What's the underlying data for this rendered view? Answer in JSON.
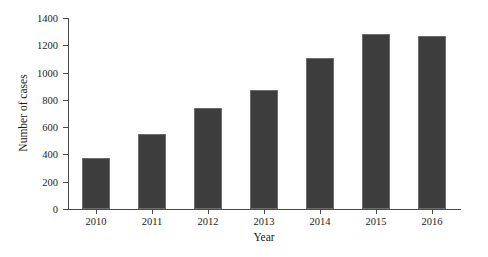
{
  "chart_data": {
    "type": "bar",
    "title": "",
    "xlabel": "Year",
    "ylabel": "Number of cases",
    "categories": [
      "2010",
      "2011",
      "2012",
      "2013",
      "2014",
      "2015",
      "2016"
    ],
    "values": [
      375,
      550,
      740,
      870,
      1105,
      1280,
      1265
    ],
    "series": [
      {
        "name": "Number of cases",
        "values": [
          375,
          550,
          740,
          870,
          1105,
          1280,
          1265
        ]
      }
    ],
    "ylim": [
      0,
      1400
    ],
    "yticks": [
      0,
      200,
      400,
      600,
      800,
      1000,
      1200,
      1400
    ],
    "ytick_labels": [
      "0",
      "200",
      "400",
      "600",
      "800",
      "1000",
      "1200",
      "1400"
    ],
    "grid": false,
    "legend": null,
    "bar_color": "#3d3d3d",
    "bar_edge_color": "#6e6e6e",
    "axis_color": "#4a4a4a",
    "text_color": "#1b1b1b",
    "background": "#ffffff"
  }
}
